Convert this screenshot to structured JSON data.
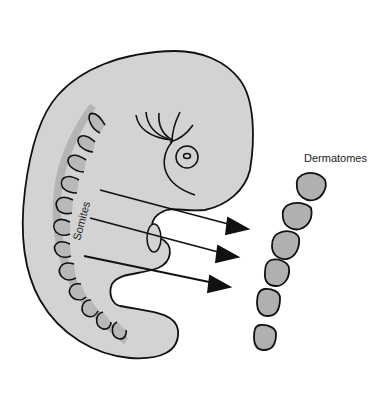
{
  "diagram": {
    "labels": {
      "somites": "Somites",
      "dermatomes": "Dermatomes"
    },
    "colors": {
      "background": "#ffffff",
      "embryo_fill": "#d3d3d3",
      "somite_fill": "#b4b4b4",
      "dermatome_fill": "#b0b0b0",
      "outline": "#111111"
    },
    "arrows_count": 3,
    "dermatomes_count": 6
  }
}
